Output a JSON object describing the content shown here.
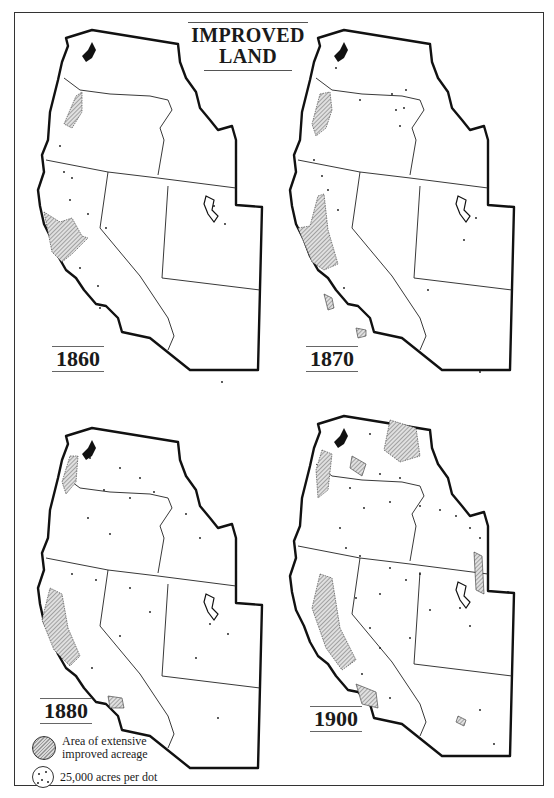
{
  "title": {
    "line1": "IMPROVED",
    "line2": "LAND"
  },
  "panels": [
    {
      "year": "1860",
      "position": "top-left"
    },
    {
      "year": "1870",
      "position": "top-right"
    },
    {
      "year": "1880",
      "position": "bottom-left"
    },
    {
      "year": "1900",
      "position": "bottom-right"
    }
  ],
  "legend": {
    "items": [
      {
        "symbol": "hatched-area",
        "label_line1": "Area of extensive",
        "label_line2": "improved acreage"
      },
      {
        "symbol": "dot",
        "label_line1": "25,000 acres per dot"
      }
    ]
  },
  "colors": {
    "ink": "#1a1a1a",
    "hatch_fill": "#bdbdbd",
    "paper": "#ffffff"
  }
}
